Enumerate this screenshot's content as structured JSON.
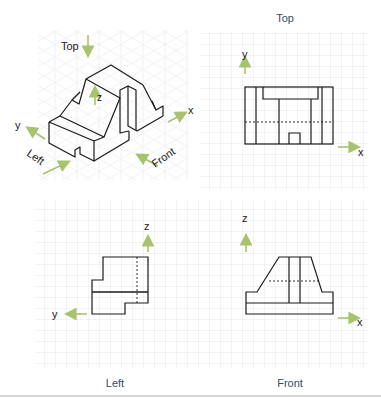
{
  "colors": {
    "grid": "#e6e8ea",
    "outline": "#1a1a1a",
    "arrow": "#a9c26e",
    "label": "#3b4a5c"
  },
  "isometric": {
    "labels": {
      "top": "Top",
      "left": "Left",
      "front": "Front",
      "x": "x",
      "y": "y",
      "z": "z"
    }
  },
  "views": {
    "top": {
      "title": "Top",
      "axis_h": "x",
      "axis_v": "y"
    },
    "left": {
      "title": "Left",
      "axis_h": "y",
      "axis_v": "z"
    },
    "front": {
      "title": "Front",
      "axis_h": "x",
      "axis_v": "z"
    }
  }
}
